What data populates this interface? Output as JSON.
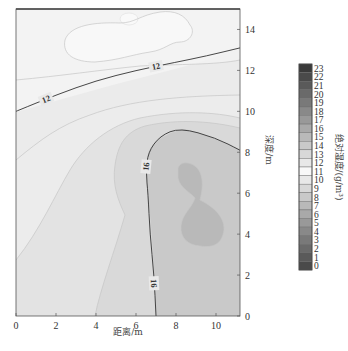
{
  "chart_data": {
    "type": "heatmap",
    "subtype": "filled-contour",
    "title": "",
    "xlabel": "距离/m",
    "ylabel": "深度/m",
    "ylabel_side": "right",
    "xlim": [
      0,
      11.2
    ],
    "ylim": [
      0,
      15
    ],
    "x_ticks": [
      0,
      2,
      4,
      6,
      8,
      10
    ],
    "y_ticks": [
      0,
      2,
      4,
      6,
      8,
      10,
      12,
      14
    ],
    "colorbar": {
      "label": "绝对湿度/(g/m³)",
      "levels": [
        0,
        1,
        2,
        3,
        4,
        5,
        6,
        7,
        8,
        9,
        10,
        11,
        12,
        13,
        14,
        15,
        16,
        17,
        18,
        19,
        20,
        21,
        22,
        23
      ],
      "colormap": "grayscale-diverging (dark at 0 and 23, light at 10-12)",
      "placement": "right"
    },
    "regions": [
      {
        "level": 11,
        "description": "lightest patch near top, x 1.6-8.4 m, depth 12.7-15 m"
      },
      {
        "level": 12,
        "description": "upper band, depth ~11.7-15 m"
      },
      {
        "level": 12,
        "description": "labeled contour line 12 from (0,10) rising to (11.2,13.1)"
      },
      {
        "level": 13,
        "description": "band below 12 line"
      },
      {
        "level": 14,
        "description": "band on left side"
      },
      {
        "level": 15,
        "description": "middle band running diagonally"
      },
      {
        "level": 16,
        "description": "labeled contour line 16 from top near (8,9.2) down to (7,0)"
      },
      {
        "level": 17,
        "description": "region right of contour 16"
      },
      {
        "level": 18,
        "description": "darkest inner patch x 8-10.5 m, depth 3.7-7.5 m"
      }
    ],
    "contour_lines": [
      {
        "value": 12,
        "points": [
          [
            0,
            10.0
          ],
          [
            2,
            10.8
          ],
          [
            4,
            11.5
          ],
          [
            6,
            12.0
          ],
          [
            8,
            12.4
          ],
          [
            9.5,
            12.7
          ],
          [
            11.2,
            13.1
          ]
        ],
        "labels_at": [
          [
            1.5,
            10.6
          ],
          [
            7,
            12.2
          ]
        ]
      },
      {
        "value": 16,
        "points": [
          [
            11.2,
            8.1
          ],
          [
            10,
            8.7
          ],
          [
            8.2,
            9.2
          ],
          [
            7.2,
            8.8
          ],
          [
            6.6,
            8.0
          ],
          [
            6.5,
            7.0
          ],
          [
            6.6,
            6.0
          ],
          [
            6.7,
            4.0
          ],
          [
            6.9,
            2.0
          ],
          [
            7.0,
            0
          ]
        ],
        "labels_at": [
          [
            6.5,
            7.3
          ],
          [
            6.9,
            1.6
          ]
        ]
      }
    ],
    "contour_labels": [
      "12",
      "12",
      "16",
      "16"
    ]
  }
}
